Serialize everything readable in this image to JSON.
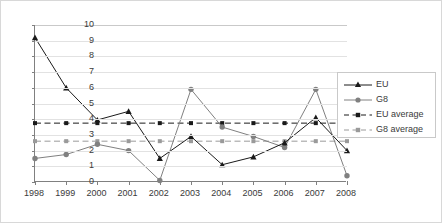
{
  "chart_data": {
    "type": "line",
    "title": "",
    "xlabel": "",
    "ylabel": "",
    "categories": [
      "1998",
      "1999",
      "2000",
      "2001",
      "2002",
      "2003",
      "2004",
      "2005",
      "2006",
      "2007",
      "2008"
    ],
    "ylim": [
      0,
      10
    ],
    "ytick_step": 1,
    "yticks": [
      "0",
      "1",
      "2",
      "3",
      "4",
      "5",
      "6",
      "7",
      "8",
      "9",
      "10"
    ],
    "grid": true,
    "legend_position": "right",
    "series": [
      {
        "name": "EU",
        "style": "solid",
        "marker": "triangle",
        "color": "#1a1a1a",
        "values": [
          9.2,
          6.0,
          3.95,
          4.5,
          1.5,
          2.9,
          1.1,
          1.6,
          2.5,
          4.1,
          2.0
        ]
      },
      {
        "name": "G8",
        "style": "solid",
        "marker": "circle",
        "color": "#808080",
        "values": [
          1.5,
          1.75,
          2.4,
          2.0,
          0.1,
          5.9,
          3.5,
          2.9,
          2.2,
          5.9,
          0.4
        ]
      },
      {
        "name": "EU average",
        "style": "dashed",
        "marker": "square",
        "color": "#1a1a1a",
        "constant": 3.75,
        "values": [
          3.75,
          3.75,
          3.75,
          3.75,
          3.75,
          3.75,
          3.75,
          3.75,
          3.75,
          3.75,
          3.75
        ]
      },
      {
        "name": "G8 average",
        "style": "dashed",
        "marker": "square",
        "color": "#9a9a9a",
        "constant": 2.6,
        "values": [
          2.6,
          2.6,
          2.6,
          2.6,
          2.6,
          2.6,
          2.6,
          2.6,
          2.6,
          2.6,
          2.6
        ]
      }
    ]
  },
  "legend": {
    "items": [
      {
        "label": "EU"
      },
      {
        "label": "G8"
      },
      {
        "label": "EU average"
      },
      {
        "label": "G8 average"
      }
    ]
  }
}
